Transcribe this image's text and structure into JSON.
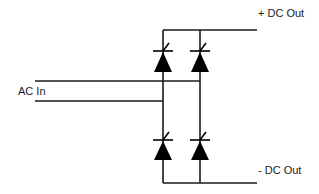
{
  "diagram": {
    "type": "full-bridge-rectifier",
    "labels": {
      "ac_in": "AC In",
      "dc_out_pos": "+ DC Out",
      "dc_out_neg": "- DC Out"
    },
    "components": [
      {
        "id": "D1",
        "kind": "thyristor-diode",
        "position": "top-left"
      },
      {
        "id": "D2",
        "kind": "thyristor-diode",
        "position": "top-right"
      },
      {
        "id": "D3",
        "kind": "thyristor-diode",
        "position": "bottom-left"
      },
      {
        "id": "D4",
        "kind": "thyristor-diode",
        "position": "bottom-right"
      }
    ],
    "colors": {
      "wire": "#1a1a1a",
      "background": "#ffffff"
    }
  }
}
